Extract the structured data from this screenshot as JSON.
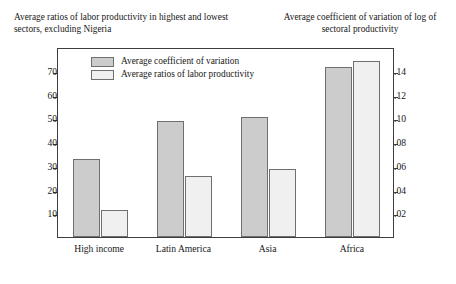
{
  "header": {
    "left": "Average ratios of labor productivity in highest and lowest sectors, excluding Nigeria",
    "right": "Average coefficient of variation of log of sectoral productivity"
  },
  "legend": {
    "items": [
      {
        "label": "Average coefficient of variation",
        "key": "cov",
        "color": "#cccccc"
      },
      {
        "label": "Average ratios of labor productivity",
        "key": "ratio",
        "color": "#f0f0f0"
      }
    ]
  },
  "axes": {
    "left": {
      "ticks": [
        "10",
        "20",
        "30",
        "40",
        "50",
        "60",
        "70"
      ],
      "values": [
        10,
        20,
        30,
        40,
        50,
        60,
        70
      ],
      "min": 0,
      "max": 80
    },
    "right": {
      "ticks": [
        ".02",
        ".04",
        ".06",
        ".08",
        ".10",
        ".12",
        ".14"
      ],
      "values": [
        0.02,
        0.04,
        0.06,
        0.08,
        0.1,
        0.12,
        0.14
      ],
      "min": 0,
      "max": 0.16
    }
  },
  "chart_data": {
    "type": "bar",
    "title": "",
    "subtitle": "",
    "xlabel": "",
    "ylabel": "Average ratios of labor productivity in highest and lowest sectors, excluding Nigeria",
    "y2label": "Average coefficient of variation of log of sectoral productivity",
    "categories": [
      "High income",
      "Latin America",
      "Asia",
      "Africa"
    ],
    "ylim": [
      0,
      80
    ],
    "y2lim": [
      0,
      0.16
    ],
    "grid": false,
    "legend_position": "inside-top-left",
    "series": [
      {
        "name": "Average coefficient of variation",
        "axis": "left",
        "color": "#cccccc",
        "values": [
          33,
          49,
          50.5,
          71.5
        ]
      },
      {
        "name": "Average ratios of labor productivity",
        "axis": "right",
        "color": "#f0f0f0",
        "values": [
          0.023,
          0.051,
          0.057,
          0.148
        ]
      }
    ]
  }
}
